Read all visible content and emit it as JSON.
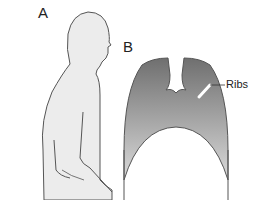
{
  "figure": {
    "panels": [
      {
        "id": "A",
        "label": "A",
        "depicts": "side silhouette of seated person"
      },
      {
        "id": "B",
        "label": "B",
        "depicts": "chest / thoracic cavity cross-section"
      }
    ],
    "annotations": {
      "ribs": "Ribs"
    },
    "colors": {
      "silhouette_fill": "#ececec",
      "outline": "#555555",
      "chest_top": "#6f6f6f",
      "chest_bottom": "#d6d6d6",
      "background": "#ffffff"
    }
  }
}
